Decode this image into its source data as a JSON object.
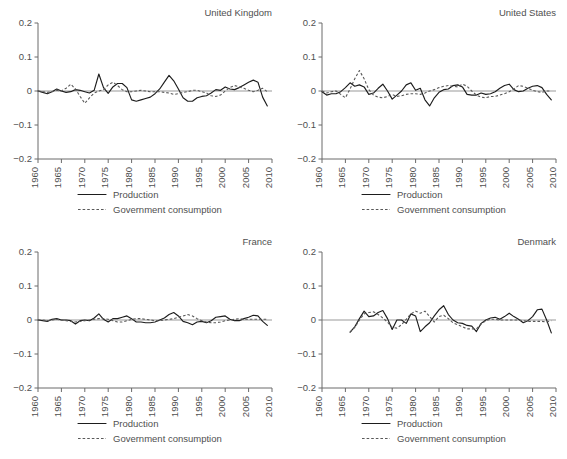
{
  "figure": {
    "width": 567,
    "height": 459,
    "background": "#ffffff",
    "series_colors": {
      "production": "#1d1d1d",
      "government_consumption": "#595959",
      "axis": "#6b6b6b",
      "zero_line": "#9a9a9a",
      "text": "#4f4f4f"
    },
    "legend": {
      "production_label": "Production",
      "government_label": "Government consumption"
    },
    "y_axis": {
      "ticks": [
        "0.2",
        "0.1",
        "0",
        "-0.1",
        "-0.2"
      ],
      "values": [
        0.2,
        0.1,
        0,
        -0.1,
        -0.2
      ],
      "lim": [
        -0.2,
        0.2
      ]
    },
    "x_axis": {
      "ticks": [
        "1960",
        "1965",
        "1970",
        "1975",
        "1980",
        "1985",
        "1990",
        "1995",
        "2000",
        "2005",
        "2010"
      ],
      "values": [
        1960,
        1965,
        1970,
        1975,
        1980,
        1985,
        1990,
        1995,
        2000,
        2005,
        2010
      ],
      "lim": [
        1960,
        2010
      ]
    }
  },
  "chart_data": [
    {
      "type": "line",
      "panel": "top-left",
      "title": "United Kingdom",
      "xlabel": "",
      "ylabel": "",
      "xlim": [
        1960,
        2010
      ],
      "ylim": [
        -0.2,
        0.2
      ],
      "grid": false,
      "legend_position": "below-axes",
      "xticks": [
        1960,
        1965,
        1970,
        1975,
        1980,
        1985,
        1990,
        1995,
        2000,
        2005,
        2010
      ],
      "yticks": [
        -0.2,
        -0.1,
        0,
        0.1,
        0.2
      ],
      "x": [
        1960,
        1961,
        1962,
        1963,
        1964,
        1965,
        1966,
        1967,
        1968,
        1969,
        1970,
        1971,
        1972,
        1973,
        1974,
        1975,
        1976,
        1977,
        1978,
        1979,
        1980,
        1981,
        1982,
        1983,
        1984,
        1985,
        1986,
        1987,
        1988,
        1989,
        1990,
        1991,
        1992,
        1993,
        1994,
        1995,
        1996,
        1997,
        1998,
        1999,
        2000,
        2001,
        2002,
        2003,
        2004,
        2005,
        2006,
        2007,
        2008,
        2009
      ],
      "series": [
        {
          "name": "Production",
          "style": "solid",
          "values": [
            0.0,
            -0.004,
            -0.008,
            -0.002,
            0.006,
            0.0,
            -0.004,
            -0.002,
            0.004,
            0.002,
            -0.002,
            -0.006,
            0.002,
            0.05,
            0.01,
            -0.007,
            0.012,
            0.022,
            0.022,
            0.01,
            -0.026,
            -0.03,
            -0.026,
            -0.022,
            -0.018,
            -0.008,
            0.006,
            0.026,
            0.046,
            0.03,
            0.006,
            -0.02,
            -0.03,
            -0.03,
            -0.02,
            -0.016,
            -0.014,
            -0.006,
            0.004,
            0.002,
            0.012,
            0.006,
            0.004,
            0.01,
            0.018,
            0.026,
            0.032,
            0.026,
            -0.018,
            -0.044
          ]
        },
        {
          "name": "Government consumption",
          "style": "dashed",
          "values": [
            0.0,
            -0.002,
            -0.004,
            -0.002,
            0.002,
            0.0,
            0.008,
            0.02,
            0.006,
            -0.016,
            -0.036,
            -0.02,
            -0.006,
            0.0,
            0.004,
            0.018,
            0.026,
            0.016,
            0.004,
            -0.002,
            -0.002,
            0.0,
            0.002,
            0.0,
            -0.002,
            -0.002,
            -0.002,
            -0.004,
            -0.006,
            -0.01,
            -0.008,
            -0.004,
            -0.002,
            0.002,
            0.002,
            -0.002,
            -0.006,
            -0.014,
            -0.016,
            -0.012,
            0.0,
            0.01,
            0.016,
            0.012,
            0.008,
            0.002,
            -0.002,
            0.002,
            0.008,
            -0.002
          ]
        }
      ]
    },
    {
      "type": "line",
      "panel": "top-right",
      "title": "United States",
      "xlabel": "",
      "ylabel": "",
      "xlim": [
        1960,
        2010
      ],
      "ylim": [
        -0.2,
        0.2
      ],
      "grid": false,
      "legend_position": "below-axes",
      "xticks": [
        1960,
        1965,
        1970,
        1975,
        1980,
        1985,
        1990,
        1995,
        2000,
        2005,
        2010
      ],
      "yticks": [
        -0.2,
        -0.1,
        0,
        0.1,
        0.2
      ],
      "x": [
        1960,
        1961,
        1962,
        1963,
        1964,
        1965,
        1966,
        1967,
        1968,
        1969,
        1970,
        1971,
        1972,
        1973,
        1974,
        1975,
        1976,
        1977,
        1978,
        1979,
        1980,
        1981,
        1982,
        1983,
        1984,
        1985,
        1986,
        1987,
        1988,
        1989,
        1990,
        1991,
        1992,
        1993,
        1994,
        1995,
        1996,
        1997,
        1998,
        1999,
        2000,
        2001,
        2002,
        2003,
        2004,
        2005,
        2006,
        2007,
        2008,
        2009
      ],
      "series": [
        {
          "name": "Production",
          "style": "solid",
          "values": [
            -0.002,
            -0.012,
            -0.008,
            -0.008,
            -0.002,
            0.01,
            0.024,
            0.014,
            0.018,
            0.012,
            -0.01,
            -0.006,
            0.008,
            0.02,
            0.0,
            -0.024,
            -0.012,
            0.0,
            0.018,
            0.024,
            0.002,
            0.008,
            -0.026,
            -0.044,
            -0.02,
            -0.004,
            0.004,
            0.006,
            0.016,
            0.018,
            0.012,
            -0.01,
            -0.012,
            -0.012,
            -0.006,
            -0.01,
            -0.008,
            -0.002,
            0.008,
            0.016,
            0.02,
            0.004,
            -0.002,
            0.0,
            0.008,
            0.014,
            0.016,
            0.01,
            -0.01,
            -0.026
          ]
        },
        {
          "name": "Government consumption",
          "style": "dashed",
          "values": [
            0.0,
            -0.006,
            -0.002,
            0.0,
            -0.01,
            -0.02,
            0.006,
            0.036,
            0.06,
            0.036,
            0.004,
            -0.012,
            -0.018,
            -0.02,
            -0.016,
            -0.01,
            -0.016,
            -0.014,
            -0.01,
            -0.008,
            -0.008,
            -0.01,
            -0.006,
            0.0,
            0.004,
            0.01,
            0.014,
            0.016,
            0.014,
            0.012,
            0.02,
            0.014,
            0.0,
            -0.012,
            -0.018,
            -0.02,
            -0.016,
            -0.016,
            -0.012,
            -0.008,
            -0.002,
            0.006,
            0.016,
            0.014,
            0.008,
            0.002,
            -0.002,
            -0.004,
            0.0,
            0.0
          ]
        }
      ]
    },
    {
      "type": "line",
      "panel": "bottom-left",
      "title": "France",
      "xlabel": "",
      "ylabel": "",
      "xlim": [
        1960,
        2010
      ],
      "ylim": [
        -0.2,
        0.2
      ],
      "grid": false,
      "legend_position": "below-axes",
      "xticks": [
        1960,
        1965,
        1970,
        1975,
        1980,
        1985,
        1990,
        1995,
        2000,
        2005,
        2010
      ],
      "yticks": [
        -0.2,
        -0.1,
        0,
        0.1,
        0.2
      ],
      "x": [
        1960,
        1961,
        1962,
        1963,
        1964,
        1965,
        1966,
        1967,
        1968,
        1969,
        1970,
        1971,
        1972,
        1973,
        1974,
        1975,
        1976,
        1977,
        1978,
        1979,
        1980,
        1981,
        1982,
        1983,
        1984,
        1985,
        1986,
        1987,
        1988,
        1989,
        1990,
        1991,
        1992,
        1993,
        1994,
        1995,
        1996,
        1997,
        1998,
        1999,
        2000,
        2001,
        2002,
        2003,
        2004,
        2005,
        2006,
        2007,
        2008,
        2009
      ],
      "series": [
        {
          "name": "Production",
          "style": "solid",
          "values": [
            0.0,
            -0.002,
            -0.004,
            0.002,
            0.004,
            0.0,
            0.0,
            -0.002,
            -0.012,
            -0.002,
            0.0,
            -0.002,
            0.006,
            0.018,
            0.002,
            -0.006,
            0.004,
            0.004,
            0.008,
            0.012,
            0.004,
            -0.006,
            -0.006,
            -0.008,
            -0.008,
            -0.006,
            0.0,
            0.006,
            0.016,
            0.022,
            0.012,
            -0.004,
            -0.008,
            -0.014,
            -0.006,
            -0.004,
            -0.008,
            -0.002,
            0.008,
            0.01,
            0.012,
            0.002,
            -0.002,
            -0.002,
            0.004,
            0.008,
            0.014,
            0.012,
            -0.004,
            -0.016
          ]
        },
        {
          "name": "Government consumption",
          "style": "dashed",
          "values": [
            0.0,
            0.0,
            -0.002,
            0.0,
            0.002,
            0.0,
            -0.002,
            -0.004,
            -0.006,
            -0.004,
            -0.002,
            0.0,
            0.002,
            0.004,
            0.004,
            0.002,
            -0.002,
            -0.006,
            -0.006,
            -0.002,
            0.002,
            0.004,
            0.004,
            0.002,
            0.0,
            -0.002,
            -0.002,
            0.0,
            0.002,
            0.004,
            0.008,
            0.012,
            0.016,
            0.012,
            0.004,
            -0.002,
            -0.006,
            -0.008,
            -0.008,
            -0.006,
            -0.002,
            0.0,
            0.002,
            0.004,
            0.002,
            0.002,
            0.002,
            0.002,
            0.002,
            0.002
          ]
        }
      ]
    },
    {
      "type": "line",
      "panel": "bottom-right",
      "title": "Denmark",
      "xlabel": "",
      "ylabel": "",
      "xlim": [
        1960,
        2010
      ],
      "ylim": [
        -0.2,
        0.2
      ],
      "grid": false,
      "legend_position": "below-axes",
      "xticks": [
        1960,
        1965,
        1970,
        1975,
        1980,
        1985,
        1990,
        1995,
        2000,
        2005,
        2010
      ],
      "yticks": [
        -0.2,
        -0.1,
        0,
        0.1,
        0.2
      ],
      "x": [
        1966,
        1967,
        1968,
        1969,
        1970,
        1971,
        1972,
        1973,
        1974,
        1975,
        1976,
        1977,
        1978,
        1979,
        1980,
        1981,
        1982,
        1983,
        1984,
        1985,
        1986,
        1987,
        1988,
        1989,
        1990,
        1991,
        1992,
        1993,
        1994,
        1995,
        1996,
        1997,
        1998,
        1999,
        2000,
        2001,
        2002,
        2003,
        2004,
        2005,
        2006,
        2007,
        2008,
        2009
      ],
      "series": [
        {
          "name": "Production",
          "style": "solid",
          "values": [
            -0.036,
            -0.02,
            0.004,
            0.026,
            0.01,
            0.012,
            0.022,
            0.028,
            0.004,
            -0.028,
            0.0,
            0.0,
            -0.01,
            0.018,
            0.012,
            -0.034,
            -0.02,
            -0.008,
            0.012,
            0.03,
            0.042,
            0.016,
            0.0,
            -0.008,
            -0.01,
            -0.016,
            -0.018,
            -0.034,
            -0.01,
            0.0,
            0.006,
            0.008,
            0.002,
            0.01,
            0.02,
            0.01,
            0.002,
            -0.008,
            -0.002,
            0.01,
            0.03,
            0.032,
            0.0,
            -0.038
          ]
        },
        {
          "name": "Government consumption",
          "style": "dashed",
          "values": [
            -0.036,
            -0.022,
            0.0,
            0.018,
            0.022,
            0.024,
            0.016,
            0.006,
            -0.006,
            -0.022,
            -0.024,
            -0.014,
            0.002,
            0.018,
            0.026,
            0.02,
            0.026,
            0.01,
            -0.006,
            0.01,
            0.014,
            0.004,
            -0.008,
            -0.014,
            -0.02,
            -0.026,
            -0.026,
            -0.026,
            -0.012,
            -0.002,
            0.002,
            0.002,
            0.0,
            0.0,
            0.0,
            0.0,
            0.0,
            -0.002,
            -0.004,
            -0.004,
            -0.004,
            -0.004,
            -0.006,
            -0.002
          ]
        }
      ]
    }
  ]
}
